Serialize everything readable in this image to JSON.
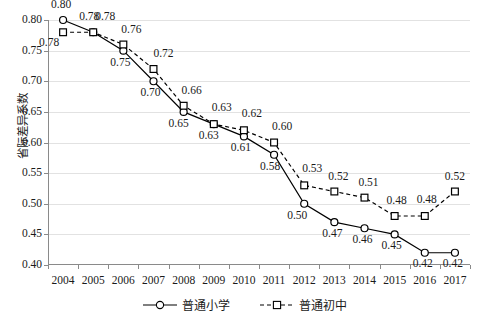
{
  "chart_data": {
    "type": "line",
    "title": "",
    "xlabel": "",
    "ylabel": "省际差异系数",
    "categories": [
      "2004",
      "2005",
      "2006",
      "2007",
      "2008",
      "2009",
      "2010",
      "2011",
      "2012",
      "2013",
      "2014",
      "2015",
      "2016",
      "2017"
    ],
    "ylim": [
      0.4,
      0.8
    ],
    "ytick_labels": [
      "0.40",
      "0.45",
      "0.50",
      "0.55",
      "0.60",
      "0.65",
      "0.70",
      "0.75",
      "0.80"
    ],
    "ytick_values": [
      0.4,
      0.45,
      0.5,
      0.55,
      0.6,
      0.65,
      0.7,
      0.75,
      0.8
    ],
    "grid": true,
    "legend_position": "bottom",
    "series": [
      {
        "name": "普通小学",
        "marker": "circle",
        "linestyle": "solid",
        "color": "#000000",
        "values": [
          0.8,
          0.78,
          0.75,
          0.7,
          0.65,
          0.63,
          0.61,
          0.58,
          0.5,
          0.47,
          0.46,
          0.45,
          0.42,
          0.42
        ],
        "labels": [
          "0.80",
          "0.78",
          "0.75",
          "0.70",
          "0.65",
          "0.63",
          "0.61",
          "0.58",
          "0.50",
          "0.47",
          "0.46",
          "0.45",
          "0.42",
          "0.42"
        ]
      },
      {
        "name": "普通初中",
        "marker": "square",
        "linestyle": "dashed",
        "color": "#000000",
        "values": [
          0.78,
          0.78,
          0.76,
          0.72,
          0.66,
          0.63,
          0.62,
          0.6,
          0.53,
          0.52,
          0.51,
          0.48,
          0.48,
          0.52
        ],
        "labels": [
          "0.78",
          "0.78",
          "0.76",
          "0.72",
          "0.66",
          "0.63",
          "0.62",
          "0.60",
          "0.53",
          "0.52",
          "0.51",
          "0.48",
          "0.48",
          "0.52"
        ]
      }
    ]
  },
  "legend": {
    "items": [
      {
        "label": "普通小学"
      },
      {
        "label": "普通初中"
      }
    ]
  }
}
